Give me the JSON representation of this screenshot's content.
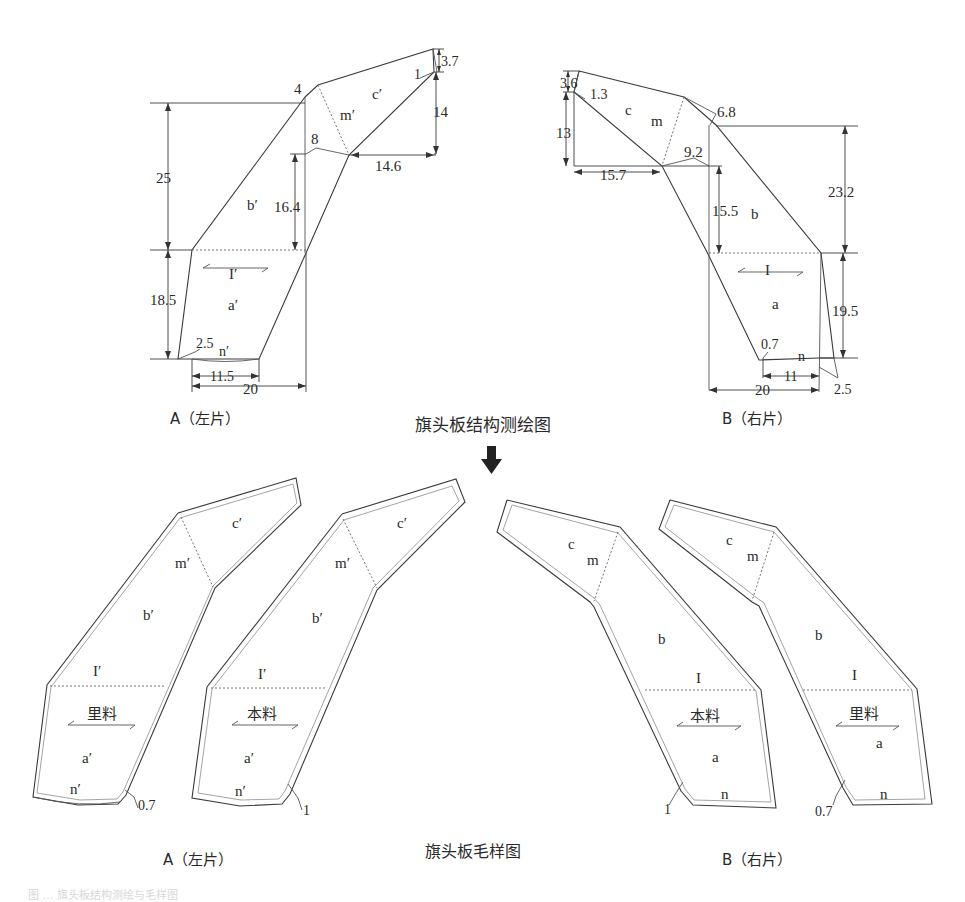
{
  "top_section": {
    "title": "旗头板结构测绘图",
    "left": {
      "caption": "A（左片）",
      "regions": [
        "c′",
        "m′",
        "b′",
        "I′",
        "a′",
        "n′"
      ],
      "dimensions": {
        "d_4": "4",
        "d_3_7": "3.7",
        "d_1": "1",
        "d_14": "14",
        "d_8": "8",
        "d_14_6": "14.6",
        "d_25": "25",
        "d_16_4": "16.4",
        "d_18_5": "18.5",
        "d_2_5": "2.5",
        "d_11_5": "11.5",
        "d_20": "20"
      }
    },
    "right": {
      "caption": "B（右片）",
      "regions": [
        "c",
        "m",
        "b",
        "I",
        "a",
        "n"
      ],
      "dimensions": {
        "d_3_6": "3.6",
        "d_1_3": "1.3",
        "d_13": "13",
        "d_15_7": "15.7",
        "d_9_2": "9.2",
        "d_6_8": "6.8",
        "d_15_5": "15.5",
        "d_23_2": "23.2",
        "d_19_5": "19.5",
        "d_0_7": "0.7",
        "d_11": "11",
        "d_20": "20",
        "d_2_5": "2.5"
      }
    }
  },
  "bottom_section": {
    "title": "旗头板毛样图",
    "left_caption": "A（左片）",
    "right_caption": "B（右片）",
    "pieces": [
      {
        "id": "A_lining",
        "material": "里料",
        "labels": [
          "c′",
          "m′",
          "b′",
          "I′",
          "a′",
          "n′"
        ],
        "seam_allowance": "0.7"
      },
      {
        "id": "A_shell",
        "material": "本料",
        "labels": [
          "c′",
          "m′",
          "b′",
          "I′",
          "a′",
          "n′"
        ],
        "seam_allowance": "1"
      },
      {
        "id": "B_shell",
        "material": "本料",
        "labels": [
          "c",
          "m",
          "b",
          "I",
          "a",
          "n"
        ],
        "seam_allowance": "1"
      },
      {
        "id": "B_lining",
        "material": "里料",
        "labels": [
          "c",
          "m",
          "b",
          "I",
          "a",
          "n"
        ],
        "seam_allowance": "0.7"
      }
    ]
  },
  "footer_note": "图 … 旗头板结构测绘与毛样图"
}
